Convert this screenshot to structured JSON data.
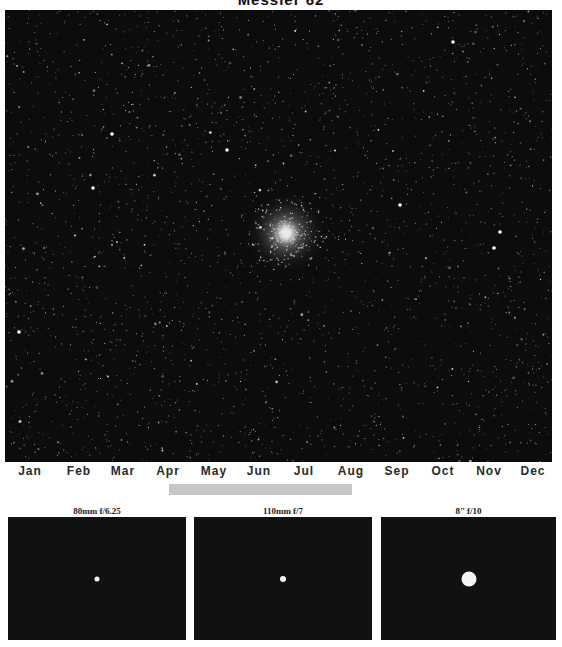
{
  "title": "Messier 62",
  "image": {
    "subject": "globular-cluster-starfield",
    "cluster_center": [
      286,
      233
    ],
    "background_color": "#0c0c0c"
  },
  "months": [
    {
      "label": "Jan",
      "x": 30
    },
    {
      "label": "Feb",
      "x": 79
    },
    {
      "label": "Mar",
      "x": 123
    },
    {
      "label": "Apr",
      "x": 168
    },
    {
      "label": "May",
      "x": 214
    },
    {
      "label": "Jun",
      "x": 259
    },
    {
      "label": "Jul",
      "x": 304
    },
    {
      "label": "Aug",
      "x": 351
    },
    {
      "label": "Sep",
      "x": 397
    },
    {
      "label": "Oct",
      "x": 443
    },
    {
      "label": "Nov",
      "x": 489
    },
    {
      "label": "Dec",
      "x": 533
    }
  ],
  "visibility": {
    "start_x": 169,
    "end_x": 352,
    "color": "#c8c8c8",
    "from": "Apr",
    "to": "Aug"
  },
  "views": [
    {
      "label": "80mm f/6.25",
      "x": 8,
      "width": 178,
      "dot_size": 5
    },
    {
      "label": "110mm f/7",
      "x": 194,
      "width": 178,
      "dot_size": 6
    },
    {
      "label": "8\" f/10",
      "x": 381,
      "width": 175,
      "dot_size": 15
    }
  ]
}
